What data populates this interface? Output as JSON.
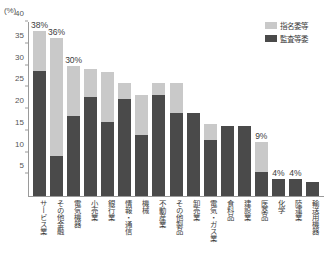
{
  "chart_data": {
    "type": "bar",
    "subtype": "stacked-bar",
    "title": "",
    "xlabel": "",
    "ylabel": "(%)",
    "ylim": [
      0,
      40
    ],
    "yticks": [
      0,
      5,
      10,
      15,
      20,
      25,
      30,
      35,
      40
    ],
    "ytick_labels": [
      "",
      "5",
      "10",
      "15",
      "20",
      "25",
      "30",
      "35",
      "40"
    ],
    "grid": false,
    "legend_position": "top-right",
    "categories": [
      "サービス業",
      "その他金融",
      "電気機器",
      "小売業",
      "銀行業",
      "情報・通信",
      "機械",
      "不動産業",
      "その他製品",
      "卸売業",
      "電気・ガス業",
      "食料品",
      "建設業",
      "医薬品",
      "化学",
      "陸運業",
      "輸送用機器"
    ],
    "series": [
      {
        "name": "監査等委",
        "color": "#4a4a4a",
        "values": [
          28.7,
          9.2,
          18.3,
          22.8,
          17.1,
          22.4,
          14.0,
          23.2,
          19.0,
          19.0,
          12.8,
          16.0,
          16.0,
          5.5,
          4.0,
          4.0,
          3.2
        ]
      },
      {
        "name": "指名委等",
        "color": "#c9c9c9",
        "values": [
          9.3,
          27.1,
          11.7,
          6.4,
          11.5,
          3.6,
          9.2,
          2.7,
          7.0,
          0.0,
          3.7,
          0.0,
          0.0,
          7.0,
          0.0,
          0.0,
          0.0
        ]
      }
    ],
    "totals": [
      38,
      36.3,
      30,
      29.2,
      28.6,
      26.0,
      23.2,
      25.9,
      26.0,
      19.0,
      16.5,
      16.0,
      16.0,
      12.5,
      4.0,
      4.0,
      3.2
    ],
    "data_labels": [
      {
        "index": 0,
        "text": "38%"
      },
      {
        "index": 1,
        "text": "36%"
      },
      {
        "index": 2,
        "text": "30%"
      },
      {
        "index": 13,
        "text": "9%"
      },
      {
        "index": 14,
        "text": "4%"
      },
      {
        "index": 15,
        "text": "4%"
      }
    ]
  },
  "axis": {
    "unit": "(%)"
  },
  "legend": {
    "items": [
      {
        "label": "指名委等",
        "color": "#c9c9c9"
      },
      {
        "label": "監査等委",
        "color": "#4a4a4a"
      }
    ]
  },
  "footer": {
    "note": ""
  }
}
